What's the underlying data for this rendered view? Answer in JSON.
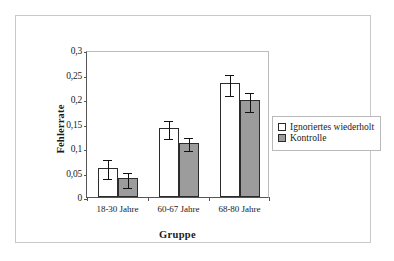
{
  "chart_data": {
    "type": "bar",
    "title": "",
    "xlabel": "Gruppe",
    "ylabel": "Fehlerrate",
    "categories": [
      "18-30 Jahre",
      "60-67 Jahre",
      "68-80 Jahre"
    ],
    "series": [
      {
        "name": "Ignoriertes wiederholt",
        "color": "#ffffff",
        "values": [
          0.06,
          0.141,
          0.232
        ],
        "errors": [
          0.019,
          0.019,
          0.021
        ]
      },
      {
        "name": "Kontrolle",
        "color": "#9c9c9c",
        "values": [
          0.038,
          0.111,
          0.197
        ],
        "errors": [
          0.015,
          0.014,
          0.019
        ]
      }
    ],
    "ylim": [
      0,
      0.3
    ],
    "ytick_values": [
      0,
      0.05,
      0.1,
      0.15,
      0.2,
      0.25,
      0.3
    ],
    "ytick_labels": [
      "0",
      "0,05",
      "0,1",
      "0,15",
      "0,2",
      "0,25",
      "0,3"
    ],
    "grid": false,
    "legend_position": "right",
    "error_bar_type": "standard-error"
  },
  "colors": {
    "series_white": "#ffffff",
    "series_gray": "#9c9c9c",
    "bar_edge": "#2b2b2b",
    "axis": "#555555",
    "frame": "#c8c8c8",
    "text": "#1a1a1a"
  }
}
